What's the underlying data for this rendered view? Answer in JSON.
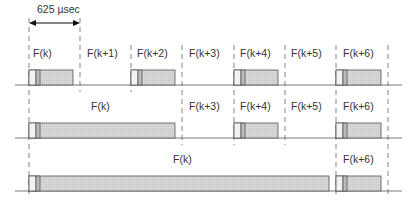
{
  "dimension": {
    "label": "625 µsec"
  },
  "rows": [
    {
      "labels": [
        {
          "text": "F(k)",
          "x": 33,
          "y": 47
        },
        {
          "text": "F(k+1)",
          "x": 87,
          "y": 47
        },
        {
          "text": "F(k+2)",
          "x": 137,
          "y": 47
        },
        {
          "text": "F(k+3)",
          "x": 189,
          "y": 47
        },
        {
          "text": "F(k+4)",
          "x": 240,
          "y": 47
        },
        {
          "text": "F(k+5)",
          "x": 291,
          "y": 47
        },
        {
          "text": "F(k+6)",
          "x": 343,
          "y": 47
        }
      ]
    },
    {
      "labels": [
        {
          "text": "F(k)",
          "x": 91,
          "y": 100
        },
        {
          "text": "F(k+3)",
          "x": 189,
          "y": 100
        },
        {
          "text": "F(k+4)",
          "x": 240,
          "y": 100
        },
        {
          "text": "F(k+5)",
          "x": 291,
          "y": 100
        },
        {
          "text": "F(k+6)",
          "x": 343,
          "y": 100
        }
      ]
    },
    {
      "labels": [
        {
          "text": "F(k)",
          "x": 173,
          "y": 153
        },
        {
          "text": "F(k+6)",
          "x": 343,
          "y": 153
        }
      ]
    }
  ],
  "colors": {
    "packet_fill": "#d9d9d9",
    "line": "#555555"
  }
}
